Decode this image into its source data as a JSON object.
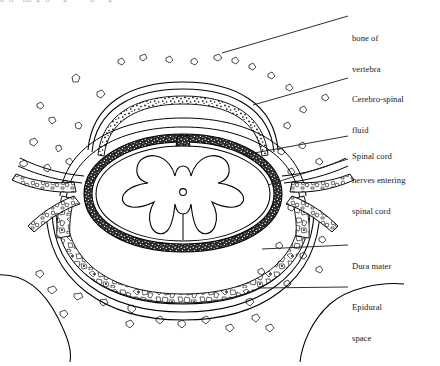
{
  "figure": {
    "kind": "anatomical-line-drawing",
    "background_color": "#ffffff",
    "ink_color": "#000000",
    "label_color": "#1a1a1a",
    "partial_top_text": "a  ll    pp  g  p      g          p      g"
  },
  "labels": [
    {
      "id": "bone-of-vertebra",
      "line1": "bone of",
      "line2": "vertebra",
      "x": 352,
      "y": 13
    },
    {
      "id": "cerebro-spinal-fluid",
      "line1": "Cerebro-spinal",
      "line2": "fluid",
      "x": 352,
      "y": 74
    },
    {
      "id": "spinal-cord",
      "line1": "Spinal cord",
      "line2": "",
      "x": 352,
      "y": 131
    },
    {
      "id": "nerves-entering-spinal-cord",
      "line1": "nerves entering",
      "line2": "spinal cord",
      "x": 352,
      "y": 155
    },
    {
      "id": "dura-mater",
      "line1": "Dura mater",
      "line2": "",
      "x": 352,
      "y": 241
    },
    {
      "id": "epidural-space",
      "line1": "Epidural",
      "line2": "space",
      "x": 352,
      "y": 282
    }
  ],
  "leader_lines": [
    {
      "id": "leader-bone-of-vertebra",
      "x1": 222,
      "y1": 53,
      "x2": 348,
      "y2": 16
    },
    {
      "id": "leader-cerebro-spinal-fluid",
      "x1": 253,
      "y1": 105,
      "x2": 348,
      "y2": 78
    },
    {
      "id": "leader-spinal-cord",
      "x1": 243,
      "y1": 155,
      "x2": 348,
      "y2": 136
    },
    {
      "id": "leader-nerves-entering",
      "x1": 268,
      "y1": 185,
      "x2": 348,
      "y2": 159
    },
    {
      "id": "leader-dura-mater",
      "x1": 262,
      "y1": 249,
      "x2": 348,
      "y2": 245
    },
    {
      "id": "leader-epidural-space",
      "x1": 258,
      "y1": 288,
      "x2": 348,
      "y2": 287
    }
  ],
  "structures": [
    {
      "id": "spinal-cord-white-matter",
      "description": "oval outline of cord"
    },
    {
      "id": "grey-matter-butterfly",
      "description": "butterfly shaped grey matter"
    },
    {
      "id": "central-canal",
      "description": "small circle at cord centre",
      "cx": 183,
      "cy": 192,
      "r": 3.4
    },
    {
      "id": "pia-arachnoid-band",
      "description": "dark stippled band hugging cord"
    },
    {
      "id": "dura-mater-sheath",
      "description": "outer double-line membrane"
    },
    {
      "id": "subarachnoid-space",
      "description": "clear gap containing cerebro-spinal fluid"
    },
    {
      "id": "epidural-fat",
      "description": "coarse cellular fat filling epidural space"
    },
    {
      "id": "nerve-root-left",
      "description": "nerve roots exiting to the left"
    },
    {
      "id": "nerve-root-right",
      "description": "nerve roots exiting to the right"
    },
    {
      "id": "cancellous-bone-field",
      "description": "scattered bone marrow specks"
    },
    {
      "id": "vertebral-bone-outline",
      "description": "sweeping bone contours at corners"
    }
  ]
}
